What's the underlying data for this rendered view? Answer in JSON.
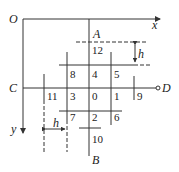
{
  "diagram": {
    "origin_label": "O",
    "x_axis_label": "x",
    "y_axis_label": "y",
    "point_labels": {
      "A": "A",
      "B": "B",
      "C": "C",
      "D": "D"
    },
    "spacing_label_vertical": "h",
    "spacing_label_horizontal": "h",
    "node_numbers": {
      "n12": "12",
      "n8": "8",
      "n4": "4",
      "n5": "5",
      "n11": "11",
      "n3": "3",
      "n0": "0",
      "n1": "1",
      "n9": "9",
      "n7": "7",
      "n2": "2",
      "n6": "6",
      "n10": "10"
    },
    "colors": {
      "line": "#333333",
      "background": "#ffffff"
    }
  }
}
